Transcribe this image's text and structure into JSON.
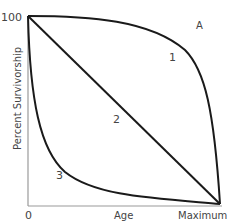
{
  "panel_label": "A",
  "axes": {
    "y_label": "Percent Survivorship",
    "y_max_label": "100",
    "x_label": "Age",
    "x_min_label": "0",
    "x_max_label": "Maximum"
  },
  "curves": [
    {
      "id": "1",
      "label": "1",
      "description": "Type I: high survivorship until late life, then rapid decline"
    },
    {
      "id": "2",
      "label": "2",
      "description": "Type II: constant mortality, linear decline"
    },
    {
      "id": "3",
      "label": "3",
      "description": "Type III: high early mortality, few survive to old age"
    }
  ],
  "colors": {
    "curve": "#1a1a1a",
    "axis": "#9a9a9a",
    "text": "#444444"
  }
}
